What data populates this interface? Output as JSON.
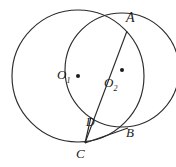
{
  "figure": {
    "background_color": "#ffffff",
    "stroke_color": "#2b2b2b",
    "label_color": "#1a1a1a"
  },
  "labels": {
    "A": "A",
    "B": "B",
    "C": "C",
    "D": "D",
    "O1_base": "O",
    "O1_sub": "1",
    "O2_base": "O",
    "O2_sub": "2"
  },
  "chart_data": {
    "type": "diagram",
    "xlabel": "",
    "ylabel": "",
    "xlim": [
      0,
      176
    ],
    "ylim": [
      0,
      167
    ],
    "grid": false,
    "legend": "none",
    "circles": [
      {
        "name": "circle-O1",
        "center_label": "O1",
        "cx": 78,
        "cy": 76,
        "r": 66
      },
      {
        "name": "circle-O2",
        "center_label": "O2",
        "cx": 122,
        "cy": 70,
        "r": 57
      }
    ],
    "points": [
      {
        "name": "A",
        "x": 127,
        "y": 31,
        "marker": "none"
      },
      {
        "name": "B",
        "x": 128,
        "y": 128,
        "marker": "none"
      },
      {
        "name": "C",
        "x": 85,
        "y": 143,
        "marker": "none"
      },
      {
        "name": "D",
        "x": 93,
        "y": 119,
        "marker": "none"
      },
      {
        "name": "O1",
        "x": 78,
        "y": 76,
        "marker": "dot"
      },
      {
        "name": "O2",
        "x": 122,
        "y": 70,
        "marker": "dot"
      }
    ],
    "segments": [
      {
        "name": "segment-CA",
        "from": "C",
        "to": "A"
      },
      {
        "name": "segment-CB",
        "from": "C",
        "to": "B"
      },
      {
        "name": "segment-CD",
        "from": "C",
        "to": "D"
      }
    ]
  }
}
